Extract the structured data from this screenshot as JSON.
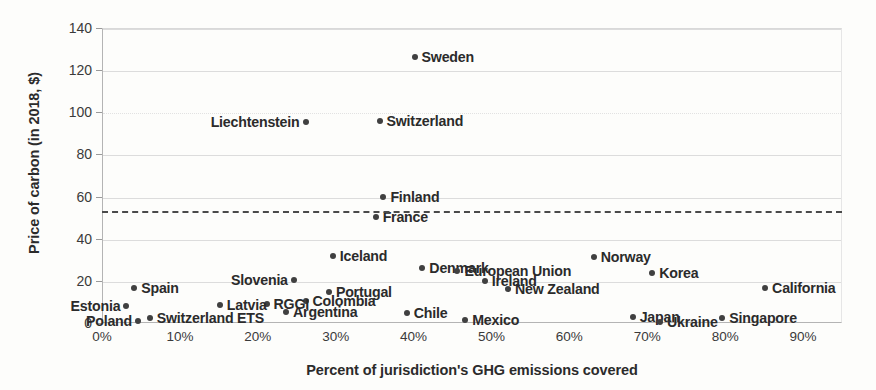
{
  "chart_data": {
    "type": "scatter",
    "title": "",
    "xlabel": "Percent of jurisdiction's GHG emissions covered",
    "ylabel": "Price of carbon (in 2018, $)",
    "xlim": [
      0,
      95
    ],
    "ylim": [
      0,
      140
    ],
    "xticks": [
      "0%",
      "10%",
      "20%",
      "30%",
      "40%",
      "50%",
      "60%",
      "70%",
      "80%",
      "90%"
    ],
    "xtick_values": [
      0,
      10,
      20,
      30,
      40,
      50,
      60,
      70,
      80,
      90
    ],
    "yticks": [
      "0",
      "20",
      "40",
      "60",
      "80",
      "100",
      "120",
      "140"
    ],
    "ytick_values": [
      0,
      20,
      40,
      60,
      80,
      100,
      120,
      140
    ],
    "grid": "horizontal",
    "legend": "none",
    "marker_color": "#404040",
    "threshold": {
      "value": 53,
      "style": "dashed",
      "color": "#4a4a4a",
      "label": ""
    },
    "points": [
      {
        "name": "Sweden",
        "x": 40.0,
        "y": 126.5,
        "label_pos": "right"
      },
      {
        "name": "Switzerland",
        "x": 35.5,
        "y": 96.5,
        "label_pos": "right"
      },
      {
        "name": "Liechtenstein",
        "x": 26.0,
        "y": 96.0,
        "label_pos": "left"
      },
      {
        "name": "Finland",
        "x": 36.0,
        "y": 60.5,
        "label_pos": "right"
      },
      {
        "name": "France",
        "x": 35.0,
        "y": 51.0,
        "label_pos": "right"
      },
      {
        "name": "Iceland",
        "x": 29.5,
        "y": 32.5,
        "label_pos": "right"
      },
      {
        "name": "Norway",
        "x": 63.0,
        "y": 32.0,
        "label_pos": "right"
      },
      {
        "name": "Denmark",
        "x": 41.0,
        "y": 26.5,
        "label_pos": "right"
      },
      {
        "name": "European Union",
        "x": 45.5,
        "y": 25.0,
        "label_pos": "right"
      },
      {
        "name": "Korea",
        "x": 70.5,
        "y": 24.0,
        "label_pos": "right"
      },
      {
        "name": "Slovenia",
        "x": 24.5,
        "y": 21.0,
        "label_pos": "left"
      },
      {
        "name": "Ireland",
        "x": 49.0,
        "y": 20.5,
        "label_pos": "right"
      },
      {
        "name": "New Zealand",
        "x": 52.0,
        "y": 16.5,
        "label_pos": "right"
      },
      {
        "name": "Spain",
        "x": 4.0,
        "y": 17.0,
        "label_pos": "right"
      },
      {
        "name": "California",
        "x": 85.0,
        "y": 17.0,
        "label_pos": "right"
      },
      {
        "name": "Portugal",
        "x": 29.0,
        "y": 15.0,
        "label_pos": "right"
      },
      {
        "name": "Colombia",
        "x": 26.0,
        "y": 11.0,
        "label_pos": "right"
      },
      {
        "name": "RGGI",
        "x": 21.0,
        "y": 9.5,
        "label_pos": "right"
      },
      {
        "name": "Latvia",
        "x": 15.0,
        "y": 9.0,
        "label_pos": "right"
      },
      {
        "name": "Estonia",
        "x": 3.0,
        "y": 8.5,
        "label_pos": "left"
      },
      {
        "name": "Argentina",
        "x": 23.5,
        "y": 5.5,
        "label_pos": "right"
      },
      {
        "name": "Chile",
        "x": 39.0,
        "y": 5.0,
        "label_pos": "right"
      },
      {
        "name": "Switzerland ETS",
        "x": 6.0,
        "y": 3.0,
        "label_pos": "right"
      },
      {
        "name": "Mexico",
        "x": 46.5,
        "y": 2.0,
        "label_pos": "right"
      },
      {
        "name": "Japan",
        "x": 68.0,
        "y": 3.5,
        "label_pos": "right"
      },
      {
        "name": "Ukraine",
        "x": 71.5,
        "y": 1.0,
        "label_pos": "right"
      },
      {
        "name": "Singapore",
        "x": 79.5,
        "y": 3.0,
        "label_pos": "right"
      },
      {
        "name": "Poland",
        "x": 4.5,
        "y": 1.5,
        "label_pos": "left"
      }
    ]
  }
}
